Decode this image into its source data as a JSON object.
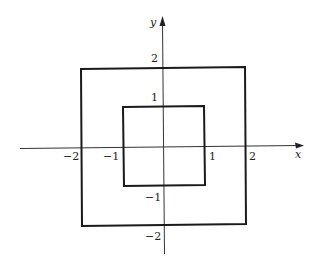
{
  "diagram": {
    "axes": {
      "x_label": "x",
      "y_label": "y",
      "x_ticks": [
        {
          "value": -2,
          "label": "−2"
        },
        {
          "value": -1,
          "label": "−1"
        },
        {
          "value": 1,
          "label": "1"
        },
        {
          "value": 2,
          "label": "2"
        }
      ],
      "y_ticks": [
        {
          "value": 2,
          "label": "2"
        },
        {
          "value": 1,
          "label": "1"
        },
        {
          "value": -1,
          "label": "−1"
        },
        {
          "value": -2,
          "label": "−2"
        }
      ]
    },
    "shapes": [
      {
        "name": "outer-square",
        "type": "square",
        "x_min": -2,
        "x_max": 2,
        "y_min": -2,
        "y_max": 2
      },
      {
        "name": "inner-square",
        "type": "square",
        "x_min": -1,
        "x_max": 1,
        "y_min": -1,
        "y_max": 1
      }
    ],
    "colors": {
      "line": "#1a1a1a",
      "axis": "#333333",
      "background": "#ffffff"
    }
  }
}
